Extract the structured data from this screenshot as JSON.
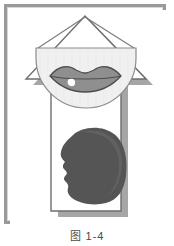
{
  "figure": {
    "caption": "图 1-4",
    "frame": {
      "border_color": "#9a9a9a",
      "background_color": "#ffffff",
      "inner_line_color": "#d8d8d8"
    },
    "artwork": {
      "title": "speech-organs-diagram",
      "elements": [
        {
          "name": "up-arrow-shape",
          "description": "Large upward pointing arrow (house-like outline) with white fill and gray outline",
          "fill": "#ffffff",
          "stroke": "#6e6e6e"
        },
        {
          "name": "arrow-drop-shadow",
          "description": "Gray drop shadow of the arrow offset down and to the right",
          "fill": "#a6a6a6"
        },
        {
          "name": "mouth-semicircle",
          "description": "Light gray semicircular panel with flat top edge holding the lips",
          "fill": "#f0f0f0",
          "stroke": "#8c8c8c"
        },
        {
          "name": "lips-icon",
          "description": "Pair of gray lips with darker outline and a white highlight on the lower lip",
          "fill": "#8f8f8f",
          "stroke": "#4d4d4d",
          "highlight": "#ffffff"
        },
        {
          "name": "head-profile-silhouette",
          "description": "Dark gray head shown in left-facing profile silhouette",
          "fill": "#555555"
        }
      ]
    }
  },
  "colors": {
    "frame_gray": "#9a9a9a",
    "shadow_gray": "#a6a6a6",
    "outline_gray": "#6e6e6e",
    "panel_gray": "#f0f0f0",
    "lip_gray": "#8f8f8f",
    "lip_outline": "#4d4d4d",
    "head_gray": "#555555",
    "page_white": "#ffffff",
    "caption_color": "#4a4a4a"
  }
}
